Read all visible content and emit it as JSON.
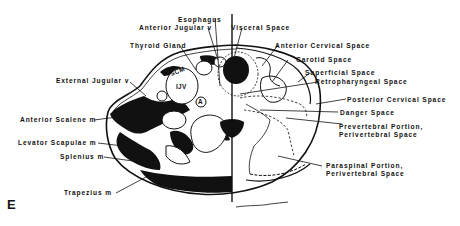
{
  "figure": {
    "panel_letter": "E",
    "colors": {
      "ink": "#111111",
      "background": "#ffffff"
    }
  },
  "labels_left": [
    {
      "id": "esophagus",
      "text": "Esophagus"
    },
    {
      "id": "anterior_jugular",
      "text": "Anterior Jugular v"
    },
    {
      "id": "thyroid_gland",
      "text": "Thyroid Gland"
    },
    {
      "id": "external_jugular",
      "text": "External Jugular v"
    },
    {
      "id": "anterior_scalene",
      "text": "Anterior Scalene m"
    },
    {
      "id": "levator_scapulae",
      "text": "Levator Scapulae m"
    },
    {
      "id": "splenius",
      "text": "Splenius m"
    },
    {
      "id": "trapezius",
      "text": "Trapezius m"
    }
  ],
  "labels_right": [
    {
      "id": "visceral_space",
      "text": "Visceral Space"
    },
    {
      "id": "anterior_cervical",
      "text": "Anterior Cervical Space"
    },
    {
      "id": "carotid_space",
      "text": "Carotid Space"
    },
    {
      "id": "superficial_space",
      "text": "Superficial Space"
    },
    {
      "id": "retropharyngeal",
      "text": "Retropharyngeal Space"
    },
    {
      "id": "posterior_cervical",
      "text": "Posterior Cervical Space"
    },
    {
      "id": "danger_space",
      "text": "Danger Space"
    },
    {
      "id": "prevertebral_1",
      "text": "Prevertebral Portion,"
    },
    {
      "id": "prevertebral_2",
      "text": "Perivertebral Space"
    },
    {
      "id": "paraspinal_1",
      "text": "Paraspinal Portion,"
    },
    {
      "id": "paraspinal_2",
      "text": "Perivertebral Space"
    }
  ],
  "inner_labels": {
    "scm": "SCM",
    "ijv": "IJV",
    "artery": "A"
  }
}
